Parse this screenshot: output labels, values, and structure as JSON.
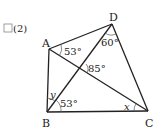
{
  "problem": {
    "checkbox": "□",
    "number": "(2)"
  },
  "points": {
    "A": {
      "label": "A",
      "x": 49,
      "y": 49
    },
    "B": {
      "label": "B",
      "x": 47,
      "y": 112
    },
    "C": {
      "label": "C",
      "x": 148,
      "y": 111
    },
    "D": {
      "label": "D",
      "x": 112,
      "y": 24
    }
  },
  "segments": [
    "AB",
    "BC",
    "CD",
    "DA",
    "AC",
    "BD"
  ],
  "angles": {
    "angle_CAD": "53°",
    "angle_ADB": "60°",
    "angle_intersection": "85°",
    "angle_DBC": "53°",
    "angle_ABD": "y",
    "angle_ACB": "x"
  },
  "colors": {
    "stroke": "#222222",
    "background": "#ffffff"
  }
}
